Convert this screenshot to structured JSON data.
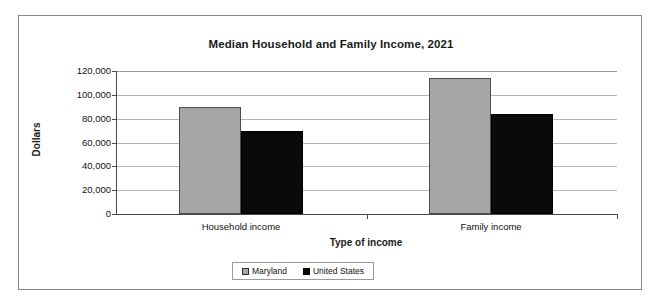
{
  "chart_data": {
    "type": "bar",
    "title": "Median Household and Family Income, 2021",
    "xlabel": "Type of income",
    "ylabel": "Dollars",
    "categories": [
      "Household income",
      "Family income"
    ],
    "series": [
      {
        "name": "Maryland",
        "color": "#a6a6a6",
        "values": [
          90000,
          114000
        ]
      },
      {
        "name": "United States",
        "color": "#0a0a0a",
        "values": [
          70000,
          84000
        ]
      }
    ],
    "ylim": [
      0,
      120000
    ],
    "ytick_labels": [
      "120,000",
      "100,000",
      "80,000",
      "60,000",
      "40,000",
      "20,000",
      "0"
    ],
    "ytick_values": [
      120000,
      100000,
      80000,
      60000,
      40000,
      20000,
      0
    ],
    "grid": true,
    "legend_position": "bottom",
    "legend_entries": [
      "Maryland",
      "United States"
    ]
  }
}
